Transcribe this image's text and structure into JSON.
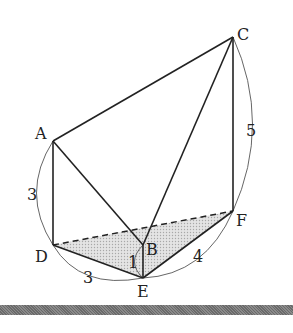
{
  "diagram": {
    "type": "triangular prism (solid)",
    "points": {
      "A": {
        "label": "A",
        "x": 53,
        "y": 141
      },
      "B": {
        "label": "B",
        "x": 143,
        "y": 245
      },
      "C": {
        "label": "C",
        "x": 233,
        "y": 37
      },
      "D": {
        "label": "D",
        "x": 53,
        "y": 245
      },
      "E": {
        "label": "E",
        "x": 143,
        "y": 278
      },
      "F": {
        "label": "F",
        "x": 233,
        "y": 211
      }
    },
    "edges_solid": [
      "AC",
      "AD",
      "AB",
      "BC",
      "CF",
      "DE",
      "EF",
      "BE"
    ],
    "edges_dashed": [
      "DF"
    ],
    "shaded_face": "DEF",
    "measurements": {
      "AD": "3",
      "CF": "5",
      "DE": "3",
      "EF": "4",
      "BE": "1"
    },
    "shade_color": "#d6d6d6",
    "line_color": "#222222"
  }
}
